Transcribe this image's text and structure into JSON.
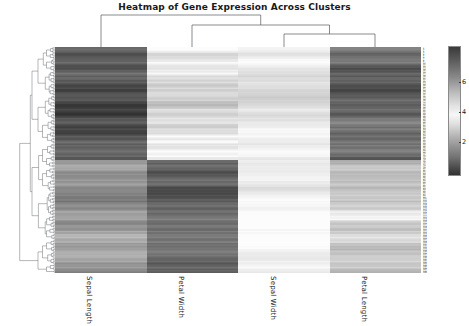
{
  "figure": {
    "title": "Heatmap of Gene Expression Across Clusters",
    "width": 469,
    "height": 326,
    "background": "#ffffff"
  },
  "chart_data": {
    "type": "heatmap",
    "title": "Heatmap of Gene Expression Across Clusters",
    "xlabel": "",
    "ylabel": "",
    "grid": false,
    "legend_position": "right",
    "colormap": "grayscale-diverging",
    "columns": [
      "Sepal Length",
      "Petal Width",
      "Sepal Width",
      "Petal Length"
    ],
    "column_dendrogram": {
      "description": "Sepal Width and Petal Length merge first, then Petal Width joins, then Sepal Length joins at root",
      "merges": [
        {
          "left": "Sepal Width",
          "right": "Petal Length",
          "height": 0.3
        },
        {
          "left": "Petal Width",
          "right": "cluster(Sepal Width, Petal Length)",
          "height": 0.62
        },
        {
          "left": "Sepal Length",
          "right": "cluster(Petal Width, Sepal Width, Petal Length)",
          "height": 1.0
        }
      ]
    },
    "row_dendrogram": {
      "description": "Dense hierarchical clustering of 150 rows, two major clusters split at root",
      "n_rows": 150,
      "root_split": [
        75,
        75
      ]
    },
    "colorbar": {
      "ticks": [
        2,
        4,
        6
      ],
      "tick_positions_frac": [
        0.755,
        0.52,
        0.285
      ],
      "vmin": 0.1,
      "vmax": 7.9,
      "orientation": "vertical"
    },
    "column_mean_values": [
      5.1,
      2.2,
      3.3,
      1.4
    ],
    "column_block_shades": [
      "#707070",
      "#b8b8b8",
      "#eeeeee",
      "#8f8f8f"
    ],
    "n_rows": 150,
    "n_cols": 4,
    "value_note": "Cell values are gene expression levels ranging roughly 0.1 to 7.9; darker = higher magnitude deviation"
  },
  "column_labels": [
    {
      "text": "Sepal Length",
      "x": 93
    },
    {
      "text": "Petal Width",
      "x": 185
    },
    {
      "text": "Sepal Width",
      "x": 277
    },
    {
      "text": "Petal Length",
      "x": 368
    }
  ],
  "colorbar_ticks": [
    {
      "label": "6",
      "y": 82
    },
    {
      "label": "4",
      "y": 112
    },
    {
      "label": "2",
      "y": 142
    }
  ]
}
